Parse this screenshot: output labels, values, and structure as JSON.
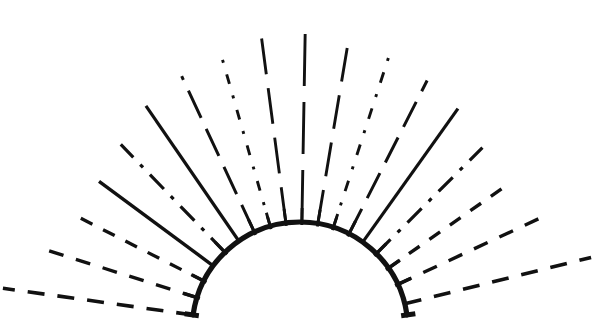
{
  "figure": {
    "canvas": {
      "width": 593,
      "height": 320,
      "background": "#ffffff"
    },
    "ink_color": "#111111",
    "geometry": {
      "center_x": 300,
      "center_y": 330,
      "arc_radius": 108,
      "arc_stroke_width": 5.2,
      "arc_start_angle_deg": -172,
      "arc_end_angle_deg": -8,
      "arc_left_endpoint": [
        163,
        315
      ],
      "arc_right_endpoint": [
        437,
        315
      ],
      "arc_apex": [
        300,
        222
      ],
      "ray_inner_radius": 108,
      "ray_count": 17
    },
    "rays": [
      {
        "name": "ray-1",
        "angle_deg": -172.0,
        "outer_radius": 300,
        "stroke_width": 3.6,
        "dash": "17 13",
        "tick": false
      },
      {
        "name": "ray-2",
        "angle_deg": -162.5,
        "outer_radius": 272,
        "stroke_width": 3.4,
        "dash": "15 13",
        "tick": true
      },
      {
        "name": "ray-3",
        "angle_deg": -153.0,
        "outer_radius": 258,
        "stroke_width": 3.3,
        "dash": "13 12",
        "tick": true
      },
      {
        "name": "ray-4",
        "angle_deg": -143.5,
        "outer_radius": 250,
        "stroke_width": 3.4,
        "dash": "0",
        "tick": false
      },
      {
        "name": "ray-5",
        "angle_deg": -134.0,
        "outer_radius": 258,
        "stroke_width": 3.2,
        "dash": "20 10 4 10",
        "tick": true
      },
      {
        "name": "ray-6",
        "angle_deg": -124.5,
        "outer_radius": 272,
        "stroke_width": 3.2,
        "dash": "0",
        "tick": false
      },
      {
        "name": "ray-7",
        "angle_deg": -115.0,
        "outer_radius": 280,
        "stroke_width": 3.0,
        "dash": "30 12",
        "tick": true
      },
      {
        "name": "ray-8",
        "angle_deg": -106.0,
        "outer_radius": 292,
        "stroke_width": 2.9,
        "dash": "10 12 3 12",
        "tick": true
      },
      {
        "name": "ray-9",
        "angle_deg": -97.5,
        "outer_radius": 300,
        "stroke_width": 2.9,
        "dash": "36 14",
        "tick": true
      },
      {
        "name": "ray-10",
        "angle_deg": -89.0,
        "outer_radius": 306,
        "stroke_width": 2.9,
        "dash": "52 16",
        "tick": true
      },
      {
        "name": "ray-11",
        "angle_deg": -80.5,
        "outer_radius": 300,
        "stroke_width": 2.9,
        "dash": "34 14",
        "tick": true
      },
      {
        "name": "ray-12",
        "angle_deg": -72.0,
        "outer_radius": 292,
        "stroke_width": 2.9,
        "dash": "11 12 3 12",
        "tick": true
      },
      {
        "name": "ray-13",
        "angle_deg": -63.0,
        "outer_radius": 280,
        "stroke_width": 3.0,
        "dash": "28 12",
        "tick": true
      },
      {
        "name": "ray-14",
        "angle_deg": -54.5,
        "outer_radius": 272,
        "stroke_width": 3.2,
        "dash": "0",
        "tick": false
      },
      {
        "name": "ray-15",
        "angle_deg": -45.0,
        "outer_radius": 258,
        "stroke_width": 3.2,
        "dash": "20 10 4 10",
        "tick": true
      },
      {
        "name": "ray-16",
        "angle_deg": -35.0,
        "outer_radius": 256,
        "stroke_width": 3.4,
        "dash": "13 12",
        "tick": true
      },
      {
        "name": "ray-17",
        "angle_deg": -25.0,
        "outer_radius": 268,
        "stroke_width": 3.4,
        "dash": "15 13",
        "tick": true
      },
      {
        "name": "ray-18",
        "angle_deg": -14.0,
        "outer_radius": 300,
        "stroke_width": 3.6,
        "dash": "17 13",
        "tick": false
      }
    ],
    "arc_ticks": [
      {
        "name": "tick-left-end",
        "angle_deg": -172.0,
        "length": 13
      },
      {
        "name": "tick-right-end",
        "angle_deg": -8.0,
        "length": 13
      }
    ]
  }
}
